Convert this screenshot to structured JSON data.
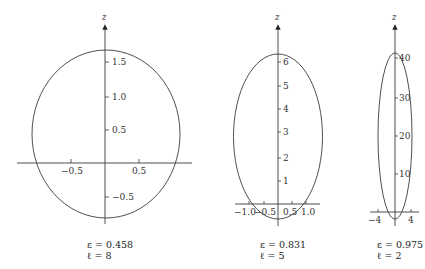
{
  "plots": [
    {
      "axis_label": "z",
      "z_ticks": [
        "1.5",
        "1.0",
        "0.5",
        "−0.5"
      ],
      "x_ticks": [
        "−0.5",
        "0.5"
      ],
      "epsilon_label": "ε = 0.458",
      "ell_label": "ℓ = 8"
    },
    {
      "axis_label": "z",
      "z_ticks": [
        "6",
        "5",
        "4",
        "3",
        "2",
        "1"
      ],
      "x_ticks": [
        "−1.0",
        "−0.5",
        "0.5",
        "1.0"
      ],
      "epsilon_label": "ε = 0.831",
      "ell_label": "ℓ = 5"
    },
    {
      "axis_label": "z",
      "z_ticks": [
        "40",
        "30",
        "20",
        "10"
      ],
      "x_ticks": [
        "−4",
        "4"
      ],
      "epsilon_label": "ε = 0.975",
      "ell_label": "ℓ = 2"
    }
  ],
  "colors": {
    "stroke": "#3a3a3a",
    "text": "#333333"
  }
}
